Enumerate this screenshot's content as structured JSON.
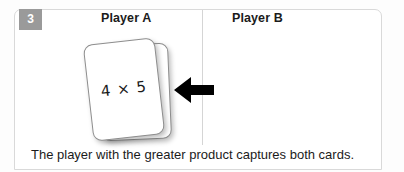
{
  "step": {
    "number": "3"
  },
  "columns": [
    {
      "label": "Player A"
    },
    {
      "label": "Player B"
    }
  ],
  "cards": {
    "front_text": "4 × 5",
    "count": 2
  },
  "arrow": {
    "direction": "left",
    "color": "#000000"
  },
  "caption": {
    "text": "The player with the greater product captures both cards."
  },
  "colors": {
    "badge_background": "#9a9a9a",
    "badge_text": "#ffffff",
    "panel_border": "#d9d9d9",
    "divider": "#d5d5d5",
    "card_border": "#8d8d8d",
    "text": "#1b1b1b"
  }
}
